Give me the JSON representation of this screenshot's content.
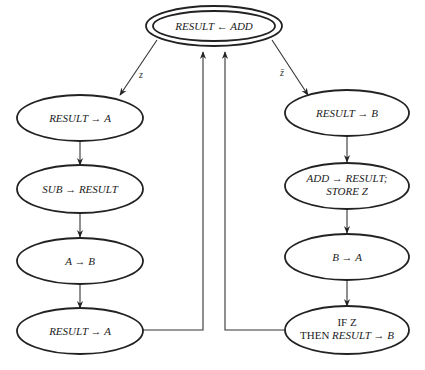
{
  "diagram": {
    "nodes": [
      {
        "id": "start",
        "label": "RESULT ← ADD",
        "style": "double"
      },
      {
        "id": "l1",
        "label": "RESULT → A"
      },
      {
        "id": "l2",
        "label": "SUB → RESULT"
      },
      {
        "id": "l3",
        "label": "A → B"
      },
      {
        "id": "l4",
        "label": "RESULT → A"
      },
      {
        "id": "r1",
        "label": "RESULT → B"
      },
      {
        "id": "r2",
        "label_line1": "ADD → RESULT;",
        "label_line2": "STORE Z"
      },
      {
        "id": "r3",
        "label": "B → A"
      },
      {
        "id": "r4",
        "label_line1": "IF  Z",
        "label_line2_prefix": "THEN ",
        "label_line2_rest": "RESULT → B"
      }
    ],
    "edges": [
      {
        "from": "start",
        "to": "l1",
        "label": "z"
      },
      {
        "from": "start",
        "to": "r1",
        "label": "z̄"
      },
      {
        "from": "l1",
        "to": "l2"
      },
      {
        "from": "l2",
        "to": "l3"
      },
      {
        "from": "l3",
        "to": "l4"
      },
      {
        "from": "l4",
        "to": "start"
      },
      {
        "from": "r1",
        "to": "r2"
      },
      {
        "from": "r2",
        "to": "r3"
      },
      {
        "from": "r3",
        "to": "r4"
      },
      {
        "from": "r4",
        "to": "start"
      }
    ]
  }
}
